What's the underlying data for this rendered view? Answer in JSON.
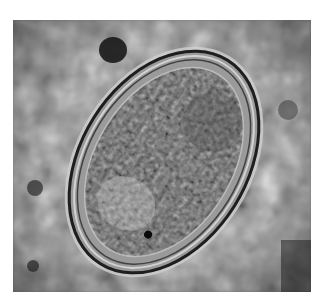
{
  "image": {
    "subject": "micrograph of an oval parasite egg",
    "mode": "grayscale",
    "colors": {
      "background_page": "#ffffff",
      "field": "#8a8a8a",
      "shell_dark": "#1e1e1e",
      "shell_light": "#d8d8d8",
      "embryo": "#5a5a5a"
    }
  }
}
